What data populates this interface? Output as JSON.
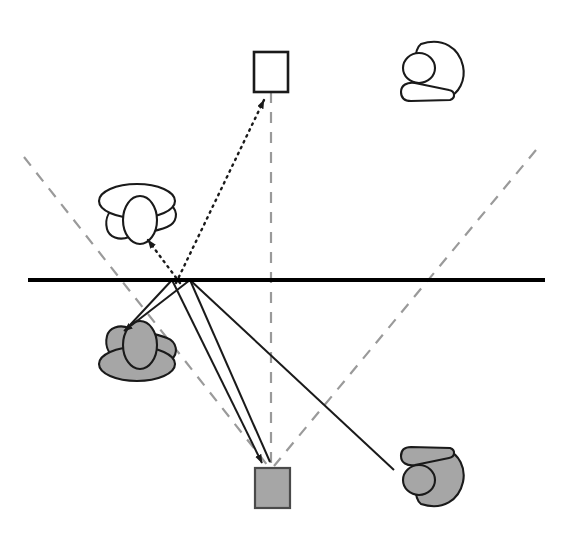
{
  "figure": {
    "canvas": {
      "width": 561,
      "height": 552,
      "background": "#ffffff"
    },
    "colors": {
      "stroke": "#1a1a1a",
      "mirror": "#000000",
      "virtual_guide": "#9a9a9a",
      "object_fill_real": "#ffffff",
      "image_fill_virtual": "#a6a6a6",
      "background": "#ffffff"
    }
  },
  "mirror": {
    "name": "mirror-line",
    "x1": 28,
    "y1": 280,
    "x2": 545,
    "y2": 280,
    "stroke_width": 4
  },
  "reflection_points": [
    {
      "name": "reflection-point-a",
      "x": 172,
      "y": 280
    },
    {
      "name": "reflection-point-b",
      "x": 190,
      "y": 280
    }
  ],
  "objects": [
    {
      "name": "white-square-object",
      "kind": "square",
      "side": "real",
      "fill": "#ffffff",
      "x": 254,
      "y": 52,
      "width": 34,
      "height": 40
    },
    {
      "name": "gray-square-image",
      "kind": "square",
      "side": "virtual",
      "fill": "#a6a6a6",
      "x": 255,
      "y": 468,
      "width": 35,
      "height": 40
    },
    {
      "name": "white-person-observer-top-right",
      "kind": "person-overhead",
      "side": "real",
      "fill": "#ffffff",
      "cx": 437,
      "cy": 70
    },
    {
      "name": "white-person-observer-left",
      "kind": "person-overhead",
      "side": "real",
      "fill": "#ffffff",
      "cx": 137,
      "cy": 215
    },
    {
      "name": "gray-person-image-left",
      "kind": "person-overhead",
      "side": "virtual",
      "fill": "#a6a6a6",
      "cx": 137,
      "cy": 350
    },
    {
      "name": "gray-person-image-bottom-right",
      "kind": "person-overhead",
      "side": "virtual",
      "fill": "#a6a6a6",
      "cx": 437,
      "cy": 478
    }
  ],
  "rays": {
    "incident_solid": [
      {
        "name": "ray-solid-to-gray-person-head",
        "x1": 190,
        "y1": 280,
        "x2": 122,
        "y2": 333,
        "arrow": true
      },
      {
        "name": "ray-solid-to-gray-person-head-second",
        "x1": 172,
        "y1": 280,
        "x2": 128,
        "y2": 327,
        "arrow": false
      },
      {
        "name": "ray-solid-to-gray-square",
        "x1": 172,
        "y1": 280,
        "x2": 262,
        "y2": 464,
        "arrow": true
      },
      {
        "name": "ray-solid-to-gray-square-second",
        "x1": 190,
        "y1": 280,
        "x2": 268,
        "y2": 462,
        "arrow": false
      },
      {
        "name": "ray-solid-to-gray-person-bottom-right",
        "x1": 190,
        "y1": 280,
        "x2": 392,
        "y2": 468,
        "arrow": false
      }
    ],
    "sightlines_dotted": [
      {
        "name": "dotted-sightline-to-white-square",
        "x1": 178,
        "y1": 282,
        "x2": 262,
        "y2": 96,
        "arrow": true
      },
      {
        "name": "dotted-sightline-to-white-person",
        "x1": 178,
        "y1": 282,
        "x2": 147,
        "y2": 240,
        "arrow": true
      }
    ],
    "virtual_dashed": [
      {
        "name": "dashed-virtual-left",
        "x1": 24,
        "y1": 157,
        "x2": 268,
        "y2": 466
      },
      {
        "name": "dashed-virtual-right",
        "x1": 536,
        "y1": 150,
        "x2": 274,
        "y2": 466
      },
      {
        "name": "dashed-virtual-vertical",
        "x1": 271,
        "y1": 92,
        "x2": 271,
        "y2": 466
      }
    ]
  },
  "legend": {
    "solid_meaning": "actual light ray path",
    "dotted_meaning": "apparent line of sight to virtual image",
    "dashed_meaning": "virtual projection behind mirror",
    "mirror_meaning": "reflecting surface"
  }
}
